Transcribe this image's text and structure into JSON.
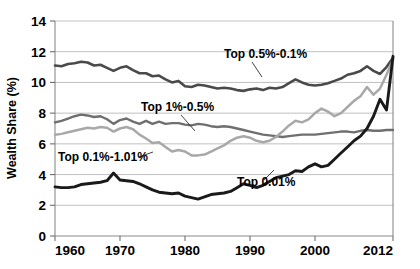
{
  "chart_data": {
    "type": "line",
    "title": "",
    "xlabel": "",
    "ylabel": "Wealth Share (%)",
    "xlim": [
      1960,
      2012
    ],
    "ylim": [
      0,
      14
    ],
    "xticks": [
      1960,
      1970,
      1980,
      1990,
      2000,
      2012
    ],
    "yticks": [
      0,
      2,
      4,
      6,
      8,
      10,
      12,
      14
    ],
    "grid": "horizontal",
    "legend": "inline-annotations",
    "x": [
      1960,
      1961,
      1962,
      1963,
      1964,
      1965,
      1966,
      1967,
      1968,
      1969,
      1970,
      1971,
      1972,
      1973,
      1974,
      1975,
      1976,
      1977,
      1978,
      1979,
      1980,
      1981,
      1982,
      1983,
      1984,
      1985,
      1986,
      1987,
      1988,
      1989,
      1990,
      1991,
      1992,
      1993,
      1994,
      1995,
      1996,
      1997,
      1998,
      1999,
      2000,
      2001,
      2002,
      2003,
      2004,
      2005,
      2006,
      2007,
      2008,
      2009,
      2010,
      2011,
      2012
    ],
    "series": [
      {
        "name": "Top 0.5%-0.1%",
        "color": "#4a4a4a",
        "width": 2.6,
        "label": "Top 0.5%-0.1%",
        "values": [
          11.1,
          11.05,
          11.2,
          11.25,
          11.35,
          11.3,
          11.1,
          11.15,
          10.95,
          10.75,
          10.95,
          11.05,
          10.8,
          10.6,
          10.6,
          10.4,
          10.45,
          10.2,
          10.0,
          10.1,
          9.75,
          9.7,
          9.85,
          9.8,
          9.7,
          9.6,
          9.65,
          9.6,
          9.5,
          9.45,
          9.55,
          9.6,
          9.5,
          9.65,
          9.6,
          9.7,
          9.95,
          10.2,
          10.0,
          9.85,
          9.8,
          9.85,
          9.95,
          10.1,
          10.25,
          10.5,
          10.6,
          10.75,
          11.05,
          10.75,
          10.55,
          11.0,
          11.6
        ]
      },
      {
        "name": "Top 1%-0.5%",
        "color": "#6f6f6f",
        "width": 2.4,
        "label": "Top 1%-0.5%",
        "values": [
          7.4,
          7.5,
          7.65,
          7.8,
          7.9,
          7.85,
          7.75,
          7.8,
          7.6,
          7.3,
          7.55,
          7.65,
          7.45,
          7.3,
          7.5,
          7.3,
          7.45,
          7.3,
          7.35,
          7.35,
          7.25,
          7.2,
          7.3,
          7.25,
          7.15,
          7.1,
          7.15,
          7.1,
          7.0,
          6.9,
          6.8,
          6.7,
          6.6,
          6.55,
          6.5,
          6.45,
          6.5,
          6.55,
          6.6,
          6.6,
          6.6,
          6.65,
          6.7,
          6.75,
          6.8,
          6.8,
          6.75,
          6.85,
          6.9,
          6.85,
          6.85,
          6.9,
          6.9
        ]
      },
      {
        "name": "Top 0.1%-0.01%",
        "color": "#a8a8a8",
        "width": 2.5,
        "label": "Top 0.1%-1.01%",
        "values": [
          6.6,
          6.65,
          6.75,
          6.85,
          6.95,
          7.05,
          7.0,
          7.1,
          7.05,
          6.8,
          7.0,
          7.1,
          6.95,
          6.6,
          6.35,
          6.05,
          6.1,
          5.8,
          5.5,
          5.6,
          5.5,
          5.25,
          5.25,
          5.3,
          5.5,
          5.7,
          5.9,
          6.2,
          6.4,
          6.5,
          6.4,
          6.2,
          6.1,
          6.2,
          6.45,
          6.8,
          7.2,
          7.5,
          7.4,
          7.6,
          8.0,
          8.3,
          8.1,
          7.8,
          8.0,
          8.4,
          8.8,
          9.1,
          9.7,
          9.2,
          9.6,
          10.5,
          11.5
        ]
      },
      {
        "name": "Top 0.01%",
        "color": "#1a1a1a",
        "width": 2.9,
        "label": "Top 0.01%",
        "values": [
          3.2,
          3.15,
          3.15,
          3.2,
          3.35,
          3.4,
          3.45,
          3.5,
          3.6,
          4.1,
          3.65,
          3.6,
          3.55,
          3.4,
          3.2,
          3.0,
          2.85,
          2.8,
          2.75,
          2.8,
          2.6,
          2.5,
          2.4,
          2.55,
          2.7,
          2.75,
          2.8,
          2.9,
          3.15,
          3.4,
          3.3,
          3.15,
          3.3,
          3.55,
          3.8,
          3.9,
          4.0,
          4.25,
          4.2,
          4.5,
          4.7,
          4.5,
          4.6,
          5.0,
          5.4,
          5.8,
          6.2,
          6.5,
          7.0,
          7.8,
          8.9,
          8.2,
          11.7
        ]
      }
    ],
    "annotations": [
      {
        "name": "Top 0.5%-0.1%",
        "text": "Top 0.5%-0.1%",
        "text_x": 224,
        "text_y": 58,
        "leader": "M 252 62 L 262 77"
      },
      {
        "name": "Top 1%-0.5%",
        "text": "Top 1%-0.5%",
        "text_x": 141,
        "text_y": 111,
        "leader": "M 181 115 L 195 131"
      },
      {
        "name": "Top 0.1%-0.01%",
        "text": "Top 0.1%-1.01%",
        "text_x": 58,
        "text_y": 161,
        "leader": "M 153 152 L 139 157"
      },
      {
        "name": "Top 0.01%",
        "text": "Top 0.01%",
        "text_x": 237,
        "text_y": 186,
        "leader": "M 264 180 L 274 170"
      }
    ]
  }
}
